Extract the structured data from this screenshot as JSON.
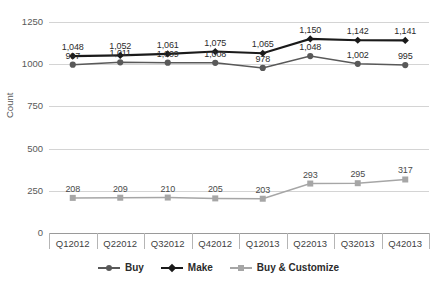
{
  "chart_data": {
    "type": "line",
    "title": "",
    "xlabel": "",
    "ylabel": "Count",
    "ylim": [
      0,
      1250
    ],
    "yticks": [
      0,
      250,
      500,
      750,
      1000,
      1250
    ],
    "ytick_labels": [
      "0",
      "250",
      "500",
      "750",
      "1000",
      "1250"
    ],
    "grid": true,
    "legend_position": "bottom",
    "categories": [
      "Q12012",
      "Q22012",
      "Q32012",
      "Q42012",
      "Q12013",
      "Q22013",
      "Q32013",
      "Q42013"
    ],
    "series": [
      {
        "name": "Buy",
        "color": "#595959",
        "marker": "circle",
        "values": [
          997,
          1011,
          1009,
          1008,
          978,
          1048,
          1002,
          995
        ],
        "labels": [
          "997",
          "1,011",
          "1,009",
          "1,008",
          "978",
          "1,048",
          "1,002",
          "995"
        ]
      },
      {
        "name": "Make",
        "color": "#1a1a1a",
        "marker": "diamond",
        "values": [
          1048,
          1052,
          1061,
          1075,
          1065,
          1150,
          1142,
          1141
        ],
        "labels": [
          "1,048",
          "1,052",
          "1,061",
          "1,075",
          "1,065",
          "1,150",
          "1,142",
          "1,141"
        ]
      },
      {
        "name": "Buy & Customize",
        "color": "#a6a6a6",
        "marker": "square",
        "values": [
          208,
          209,
          210,
          205,
          203,
          293,
          295,
          317
        ],
        "labels": [
          "208",
          "209",
          "210",
          "205",
          "203",
          "293",
          "295",
          "317"
        ]
      }
    ]
  },
  "legend": {
    "items": [
      {
        "label": "Buy"
      },
      {
        "label": "Make"
      },
      {
        "label": "Buy & Customize"
      }
    ]
  }
}
